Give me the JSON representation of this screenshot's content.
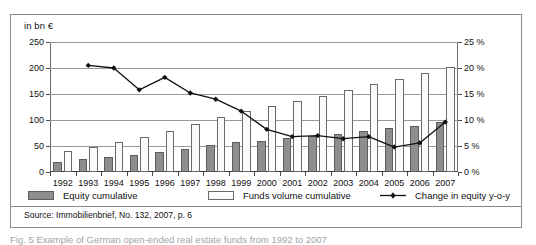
{
  "figure": {
    "axis_unit_label": "in bn €",
    "source_note": "Source: Immobilienbrief, No. 132, 2007, p. 6",
    "caption": "Fig. 5   Example of German open-ended real estate funds from 1992 to 2007"
  },
  "colors": {
    "equity_bar": "#8e8e8e",
    "equity_bar_border": "#5d5d5d",
    "funds_bar": "#fbfbfb",
    "funds_bar_border": "#6a6a6a",
    "line": "#111111",
    "gridline": "#9a9a9a",
    "frame": "#8b8b8b"
  },
  "legend": {
    "items": [
      {
        "label": "Equity cumulative",
        "marker": "filled-square-swatch"
      },
      {
        "label": "Funds volume cumulative",
        "marker": "outlined-square-swatch"
      },
      {
        "label": "Change in equity y-o-y",
        "marker": "line-with-diamond-marker"
      }
    ]
  },
  "chart_data": {
    "type": "bar",
    "title": "",
    "subtitle": "",
    "xlabel": "",
    "ylabel": "in bn €",
    "y2label": "%",
    "ylim": [
      0,
      250
    ],
    "y2lim": [
      0,
      25
    ],
    "yticks": [
      0,
      50,
      100,
      150,
      200,
      250
    ],
    "ytick_labels": [
      "0",
      "50",
      "100",
      "150",
      "200",
      "250"
    ],
    "y2ticks": [
      0,
      5,
      10,
      15,
      20,
      25
    ],
    "y2tick_labels": [
      "0 %",
      "5 %",
      "10 %",
      "15 %",
      "20 %",
      "25 %"
    ],
    "grid": true,
    "legend_position": "bottom",
    "categories": [
      "1992",
      "1993",
      "1994",
      "1995",
      "1996",
      "1997",
      "1998",
      "1999",
      "2000",
      "2001",
      "2002",
      "2003",
      "2004",
      "2005",
      "2006",
      "2007"
    ],
    "series": [
      {
        "name": "Equity cumulative",
        "type": "bar",
        "axis": "left",
        "unit": "bn €",
        "values": [
          20,
          25,
          29,
          33,
          39,
          45,
          51,
          57,
          60,
          66,
          69,
          74,
          79,
          84,
          89,
          96
        ]
      },
      {
        "name": "Funds volume cumulative",
        "type": "bar",
        "axis": "left",
        "unit": "bn €",
        "values": [
          41,
          48,
          57,
          67,
          79,
          92,
          105,
          118,
          127,
          136,
          147,
          158,
          170,
          178,
          191,
          201
        ]
      },
      {
        "name": "Change in equity y-o-y",
        "type": "line",
        "axis": "right",
        "unit": "%",
        "values": [
          null,
          20.5,
          20.0,
          15.8,
          18.2,
          15.2,
          14.0,
          11.7,
          8.2,
          6.8,
          7.0,
          6.4,
          6.8,
          4.8,
          5.6,
          9.6
        ]
      }
    ]
  }
}
